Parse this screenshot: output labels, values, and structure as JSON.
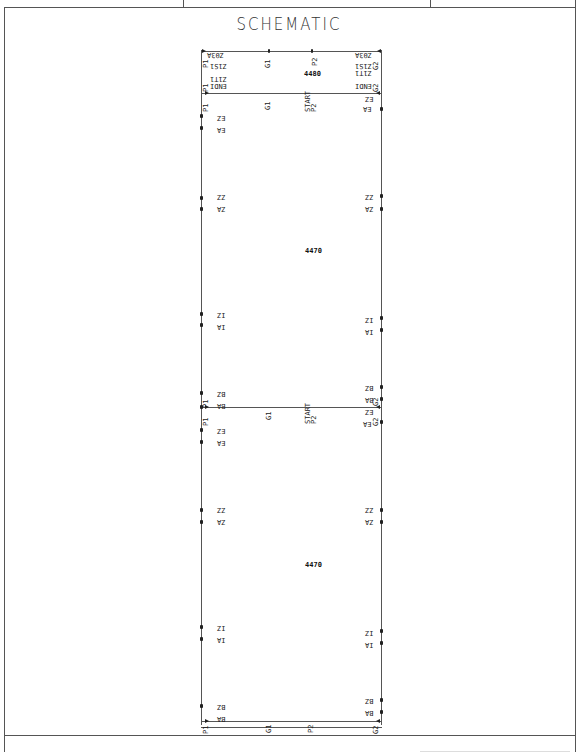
{
  "drawing": {
    "title": "SCHEMATIC",
    "header_cells": 3,
    "top_labels": {
      "left_top": "Z03A",
      "right_top": "Z03A",
      "left_2": "Z1S1",
      "right_2": "Z1S1",
      "left_3": "Z1T1",
      "right_3": "Z1T1",
      "left_4": "ENDI",
      "right_4": "ENDI",
      "g1": "G1",
      "p2": "P2",
      "p1": "P1",
      "g2": "G2",
      "dim_top": "4480"
    },
    "section_labels": {
      "left_1a": "EZ",
      "left_1b": "EA",
      "left_2a": "ZZ",
      "left_2b": "ZA",
      "left_3a": "IZ",
      "left_3b": "IA",
      "left_4a": "BZ",
      "left_4b": "BA",
      "right_1a": "EZ",
      "right_1b": "EA",
      "right_2a": "ZZ",
      "right_2b": "ZA",
      "right_3a": "IZ",
      "right_3b": "IA",
      "right_4a": "BZ",
      "right_4b": "BA"
    },
    "connector_labels": {
      "p1": "P1",
      "g1": "G1",
      "g1_sub": "(TOUT)(TOUT)",
      "start": "START",
      "stop": "STOP",
      "p2": "P2",
      "g2": "G2"
    },
    "dimensions": {
      "upper_panel": "4470",
      "lower_panel": "4470"
    }
  }
}
